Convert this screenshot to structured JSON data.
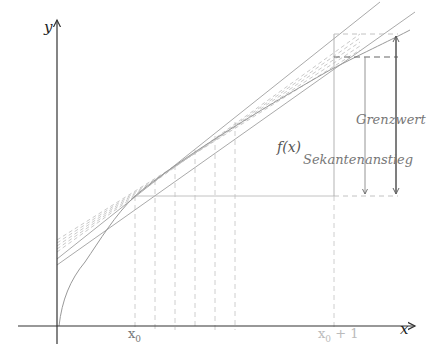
{
  "axes": {
    "x_label": "x",
    "y_label": "y"
  },
  "ticks": {
    "x0": "x",
    "x0_sub": "0",
    "x0_plus_1": "x",
    "x0_plus_1_sub": "0",
    "x0_plus_1_suffix": " + 1"
  },
  "curve": {
    "label": "f(x)"
  },
  "annotations": {
    "limit": "Grenzwert",
    "secant_slope": "Sekantenanstieg"
  },
  "colors": {
    "axis": "#333333",
    "curve": "#888888",
    "dashed": "#bbbbbb",
    "arrow": "#555555"
  }
}
